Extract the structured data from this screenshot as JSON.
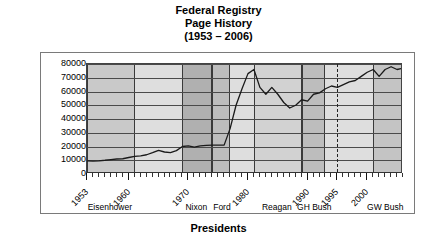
{
  "title": {
    "line1": "Federal Registry",
    "line2": "Page History",
    "line3": "(1953 – 2006)"
  },
  "axis": {
    "y_title": "Adjusted Page Count",
    "x_title": "Presidents"
  },
  "chart_data": {
    "type": "line",
    "title": "Federal Registry Page History (1953 – 2006)",
    "xlabel": "Presidents",
    "ylabel": "Adjusted Page Count",
    "xlim": [
      1953,
      2006
    ],
    "ylim": [
      0,
      80000
    ],
    "grid": true,
    "legend": null,
    "ytick_labels": [
      "80000",
      "70000",
      "60000",
      "50000",
      "40000",
      "30000",
      "20000",
      "10000",
      "0"
    ],
    "ytick_values": [
      80000,
      70000,
      60000,
      50000,
      40000,
      30000,
      20000,
      10000,
      0
    ],
    "xtick_labels": [
      "1953",
      "1960",
      "1970",
      "1980",
      "1990",
      "1995",
      "2000"
    ],
    "xtick_values": [
      1953,
      1960,
      1970,
      1980,
      1990,
      1995,
      2000
    ],
    "series": [
      {
        "name": "Adjusted Page Count",
        "color": "#1a1a1a",
        "x": [
          1953,
          1954,
          1955,
          1956,
          1957,
          1958,
          1959,
          1960,
          1961,
          1962,
          1963,
          1964,
          1965,
          1966,
          1967,
          1968,
          1969,
          1970,
          1971,
          1972,
          1973,
          1974,
          1975,
          1976,
          1977,
          1978,
          1979,
          1980,
          1981,
          1982,
          1983,
          1984,
          1985,
          1986,
          1987,
          1988,
          1989,
          1990,
          1991,
          1992,
          1993,
          1994,
          1995,
          1996,
          1997,
          1998,
          1999,
          2000,
          2001,
          2002,
          2003,
          2004,
          2005,
          2006
        ],
        "y": [
          9500,
          9400,
          9600,
          10000,
          10500,
          10900,
          11100,
          12000,
          12800,
          13200,
          14000,
          15500,
          17200,
          16000,
          15500,
          17000,
          20000,
          20500,
          19500,
          20500,
          20800,
          21000,
          21000,
          21000,
          33000,
          50000,
          62000,
          73000,
          76000,
          63000,
          58000,
          63000,
          58000,
          52000,
          48000,
          50000,
          54000,
          53000,
          58000,
          59000,
          62000,
          64000,
          63000,
          65000,
          67000,
          68000,
          71000,
          74000,
          76000,
          71000,
          76000,
          78000,
          76000,
          77000
        ]
      }
    ],
    "bands": [
      {
        "label": "Eisenhower",
        "start": 1953,
        "end": 1961,
        "shade": "#c9c9c9",
        "bordered": true
      },
      {
        "label": "",
        "start": 1961,
        "end": 1969,
        "shade": "#dedede",
        "bordered": false
      },
      {
        "label": "Nixon",
        "start": 1969,
        "end": 1974,
        "shade": "#b0b0b0",
        "bordered": true
      },
      {
        "label": "Ford",
        "start": 1974,
        "end": 1977,
        "shade": "#bdbdbd",
        "bordered": true
      },
      {
        "label": "",
        "start": 1977,
        "end": 1981,
        "shade": "#dedede",
        "bordered": false
      },
      {
        "label": "Reagan",
        "start": 1981,
        "end": 1989,
        "shade": "#d2d2d2",
        "bordered": true
      },
      {
        "label": "GH Bush",
        "start": 1989,
        "end": 1993,
        "shade": "#bdbdbd",
        "bordered": true
      },
      {
        "label": "",
        "start": 1993,
        "end": 2001,
        "shade": "#dedede",
        "bordered": false
      },
      {
        "label": "GW Bush",
        "start": 2001,
        "end": 2006,
        "shade": "#c4c4c4",
        "bordered": true
      }
    ],
    "markers": [
      {
        "type": "dashed-vline",
        "x": 1995
      }
    ],
    "president_labels": [
      {
        "label": "Eisenhower",
        "center": 1957
      },
      {
        "label": "Nixon",
        "center": 1971.5
      },
      {
        "label": "Ford",
        "center": 1975.8
      },
      {
        "label": "Reagan",
        "center": 1985
      },
      {
        "label": "GH Bush",
        "center": 1991.3
      },
      {
        "label": "GW Bush",
        "center": 2003.2
      }
    ]
  }
}
